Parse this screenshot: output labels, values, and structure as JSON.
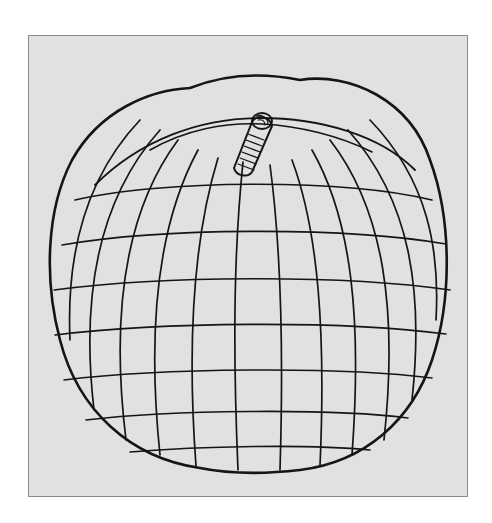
{
  "figure": {
    "colors": {
      "page_background": "#ffffff",
      "panel_background": "#e1e1e1",
      "panel_border": "#8a8a8a",
      "ink": "#151515"
    }
  }
}
